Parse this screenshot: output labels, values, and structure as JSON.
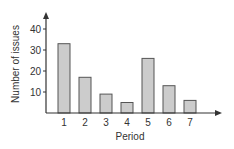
{
  "chart_data": {
    "type": "bar",
    "title": "",
    "xlabel": "Period",
    "ylabel": "Number of issues",
    "categories": [
      "1",
      "2",
      "3",
      "4",
      "5",
      "6",
      "7"
    ],
    "values": [
      33,
      17,
      9,
      5,
      26,
      13,
      6
    ],
    "yticks": [
      10,
      20,
      30,
      40
    ],
    "ylim": [
      0,
      45
    ],
    "grid": false,
    "legend": null,
    "bar_color": "#cccccc",
    "bar_edge_color": "#555555",
    "axis_color": "#333333"
  }
}
